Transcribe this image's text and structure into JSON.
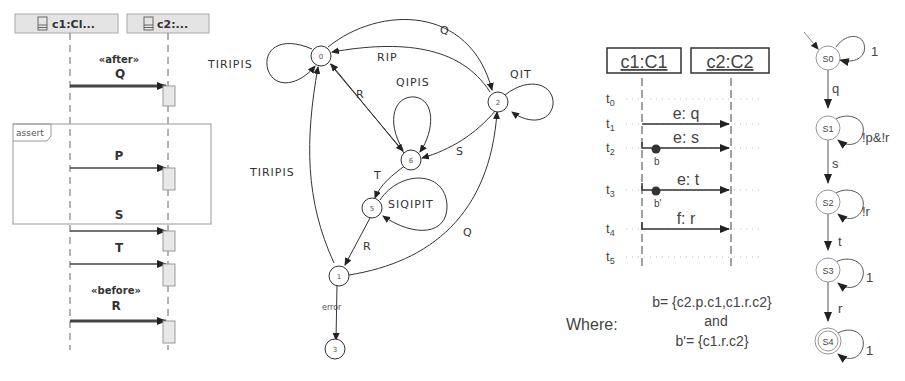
{
  "sequence_diagram": {
    "lifelines": [
      {
        "label": "c1:Cl...",
        "icon": "class-icon"
      },
      {
        "label": "c2:...",
        "icon": "class-icon"
      }
    ],
    "fragment_label": "assert",
    "messages": [
      {
        "stereotype": "«after»",
        "label": "Q"
      },
      {
        "stereotype": "",
        "label": "P"
      },
      {
        "stereotype": "",
        "label": "S"
      },
      {
        "stereotype": "",
        "label": "T"
      },
      {
        "stereotype": "«before»",
        "label": "R"
      }
    ]
  },
  "automaton": {
    "nodes": [
      {
        "id": "n0",
        "label": "0"
      },
      {
        "id": "n2",
        "label": "2"
      },
      {
        "id": "n6",
        "label": "6"
      },
      {
        "id": "n5",
        "label": "5"
      },
      {
        "id": "n1",
        "label": "1"
      },
      {
        "id": "n3",
        "label": "3"
      }
    ],
    "edges": [
      {
        "from": "0",
        "to": "0",
        "label": "TIRIPIS"
      },
      {
        "from": "0",
        "to": "2",
        "label": "Q"
      },
      {
        "from": "2",
        "to": "0",
        "label": "RIP"
      },
      {
        "from": "2",
        "to": "2",
        "label": "QIT"
      },
      {
        "from": "6",
        "to": "6",
        "label": "QIPIS"
      },
      {
        "from": "6",
        "to": "0",
        "label": "R"
      },
      {
        "from": "2",
        "to": "6",
        "label": "S"
      },
      {
        "from": "6",
        "to": "5",
        "label": "T"
      },
      {
        "from": "5",
        "to": "5",
        "label": "SIQIPIT"
      },
      {
        "from": "5",
        "to": "1",
        "label": "R"
      },
      {
        "from": "1",
        "to": "0",
        "label": "TIRIPIS"
      },
      {
        "from": "1",
        "to": "2",
        "label": "Q"
      },
      {
        "from": "1",
        "to": "3",
        "label": "error"
      }
    ]
  },
  "timed_sequence": {
    "lifelines": [
      {
        "label": "c1:C1"
      },
      {
        "label": "c2:C2"
      }
    ],
    "time_points": [
      "t0",
      "t1",
      "t2",
      "t3",
      "t4",
      "t5"
    ],
    "messages": [
      {
        "time": "t1",
        "label": "e: q",
        "marker": ""
      },
      {
        "time": "t2",
        "label": "e: s",
        "marker": "b"
      },
      {
        "time": "t3",
        "label": "e: t",
        "marker": "b'"
      },
      {
        "time": "t4",
        "label": "f: r",
        "marker": ""
      }
    ],
    "where_label": "Where:",
    "where_lines": [
      "b= {c2.p.c1,c1.r.c2}",
      "and",
      "b'= {c1.r.c2}"
    ]
  },
  "buchi_automaton": {
    "states": [
      {
        "label": "S0",
        "self_loop": "1",
        "initial": true,
        "accepting": false
      },
      {
        "label": "S1",
        "self_loop": "!p&!r",
        "initial": false,
        "accepting": false
      },
      {
        "label": "S2",
        "self_loop": "!r",
        "initial": false,
        "accepting": false
      },
      {
        "label": "S3",
        "self_loop": "1",
        "initial": false,
        "accepting": false
      },
      {
        "label": "S4",
        "self_loop": "1",
        "initial": false,
        "accepting": true
      }
    ],
    "transitions": [
      {
        "from": "S0",
        "to": "S1",
        "label": "q"
      },
      {
        "from": "S1",
        "to": "S2",
        "label": "s"
      },
      {
        "from": "S2",
        "to": "S3",
        "label": "t"
      },
      {
        "from": "S3",
        "to": "S4",
        "label": "r"
      }
    ]
  }
}
